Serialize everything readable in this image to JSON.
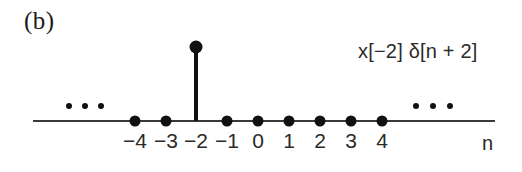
{
  "figure": {
    "panel_label": "(b)",
    "expression_label": "x[−2] δ[n + 2]",
    "axis_name": "n",
    "left_ellipsis": "•••",
    "right_ellipsis": "•••",
    "colors": {
      "ink": "#111111",
      "axis": "#3a3a3a",
      "text": "#2b2b2b",
      "background": "#ffffff"
    }
  },
  "chart_data": {
    "type": "scatter",
    "title": "",
    "subtitle": "",
    "xlabel": "n",
    "ylabel": "",
    "grid": false,
    "legend": null,
    "annotations": [
      {
        "text": "(b)",
        "role": "panel-label"
      },
      {
        "text": "x[−2] δ[n + 2]",
        "role": "signal-expression"
      },
      {
        "text": "•••",
        "role": "continuation-left"
      },
      {
        "text": "•••",
        "role": "continuation-right"
      }
    ],
    "x": [
      -4,
      -3,
      -2,
      -1,
      0,
      1,
      2,
      3,
      4
    ],
    "values": [
      0,
      0,
      1,
      0,
      0,
      0,
      0,
      0,
      0
    ],
    "xtick_labels": [
      "−4",
      "−3",
      "−2",
      "−1",
      "0",
      "1",
      "2",
      "3",
      "4"
    ],
    "xlim": [
      -5,
      5
    ],
    "ylim": [
      0,
      1.15
    ],
    "impulse": {
      "index": -2,
      "amplitude": 1,
      "label": "x[−2] δ[n + 2]"
    },
    "samples": [
      {
        "n": -4,
        "label": "−4",
        "value": 0,
        "px": 135
      },
      {
        "n": -3,
        "label": "−3",
        "value": 0,
        "px": 166
      },
      {
        "n": -2,
        "label": "−2",
        "value": 1,
        "px": 196
      },
      {
        "n": -1,
        "label": "−1",
        "value": 0,
        "px": 227
      },
      {
        "n": 0,
        "label": "0",
        "value": 0,
        "px": 258
      },
      {
        "n": 1,
        "label": "1",
        "value": 0,
        "px": 289
      },
      {
        "n": 2,
        "label": "2",
        "value": 0,
        "px": 320
      },
      {
        "n": 3,
        "label": "3",
        "value": 0,
        "px": 351
      },
      {
        "n": 4,
        "label": "4",
        "value": 0,
        "px": 382
      }
    ]
  }
}
